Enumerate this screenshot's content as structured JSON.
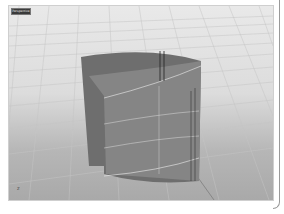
{
  "viewport": {
    "label": "Perspective",
    "axis_label": "z"
  },
  "colors": {
    "grid_light": "#e9e9e9",
    "grid_dark": "#a9a9a9",
    "surface": "#7a7a7a",
    "isocurve": "#eeeeee"
  }
}
